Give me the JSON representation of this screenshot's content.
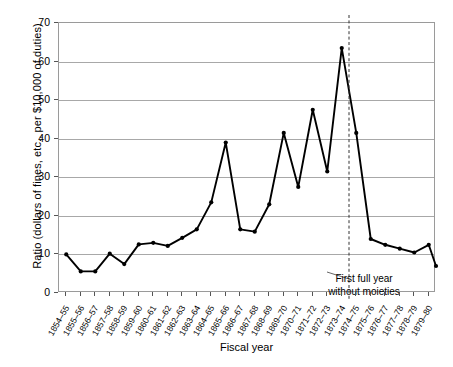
{
  "chart_data": {
    "type": "line",
    "title": "",
    "xlabel": "Fiscal year",
    "ylabel": "Ratio (dollars of fines, etc., per $10,000 of duties)",
    "ylim": [
      0,
      70
    ],
    "yticks": [
      0,
      10,
      20,
      30,
      40,
      50,
      60,
      70
    ],
    "grid": true,
    "legend": null,
    "categories": [
      "1854–55",
      "1855–56",
      "1856–57",
      "1857–58",
      "1858–59",
      "1859–60",
      "1860–61",
      "1861–62",
      "1862–63",
      "1863–64",
      "1864–65",
      "1865–66",
      "1866–67",
      "1867–68",
      "1868–69",
      "1869–70",
      "1870–71",
      "1871–72",
      "1872–73",
      "1873–74",
      "1874–75",
      "1875–76",
      "1876–77",
      "1877–78",
      "1878–79",
      "1879–80"
    ],
    "values": [
      10.0,
      5.6,
      5.6,
      10.2,
      7.5,
      12.6,
      13.0,
      12.2,
      14.3,
      16.5,
      23.5,
      39.0,
      16.5,
      15.9,
      23.0,
      41.5,
      27.5,
      47.5,
      31.5,
      63.5,
      41.5,
      14.0,
      12.5,
      11.5,
      10.5,
      12.5
    ],
    "last_value": 7.0,
    "annotations": [
      {
        "name": "first-full-year-without-moieties",
        "text_line1": "First full year",
        "text_line2": "without moieties",
        "at_category": "1874–75",
        "style": "dashed-vertical-line"
      }
    ],
    "colors": {
      "line": "#000000",
      "marker": "#000000",
      "grid": "#a8a8a8",
      "frame": "#9a9a9a",
      "background": "#ffffff"
    }
  }
}
